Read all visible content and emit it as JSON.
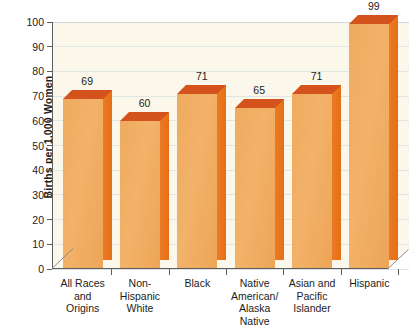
{
  "chart_data": {
    "type": "bar",
    "title": "",
    "subtitle": "",
    "xlabel": "",
    "ylabel": "Births per 1,000 Women",
    "ylim": [
      0,
      100
    ],
    "ytick_step": 10,
    "yticks": [
      "0",
      "10",
      "20",
      "30",
      "40",
      "50",
      "60",
      "70",
      "80",
      "90",
      "100"
    ],
    "grid": true,
    "grid_axis": "y",
    "legend": false,
    "legend_position": "none",
    "style": "3d-bar",
    "categories": [
      "All Races\nand\nOrigins",
      "Non-\nHispanic\nWhite",
      "Black",
      "Native\nAmerican/\nAlaska\nNative",
      "Asian and\nPacific\nIslander",
      "Hispanic"
    ],
    "category_lines": [
      [
        "All Races",
        "and",
        "Origins"
      ],
      [
        "Non-",
        "Hispanic",
        "White"
      ],
      [
        "Black"
      ],
      [
        "Native",
        "American/",
        "Alaska",
        "Native"
      ],
      [
        "Asian and",
        "Pacific",
        "Islander"
      ],
      [
        "Hispanic"
      ]
    ],
    "values": [
      69,
      60,
      71,
      65,
      71,
      99
    ],
    "data_labels": [
      "69",
      "60",
      "71",
      "65",
      "71",
      "99"
    ],
    "colors": {
      "bar_front": "#f0ab60",
      "bar_side": "#e8701d",
      "bar_top": "#d4531d",
      "plot_background": "#fbf7ea",
      "gridline": "#dfe5e3",
      "axis": "#5d5d5d",
      "text": "#1c1c1c",
      "page_background": "#ffffff"
    }
  }
}
